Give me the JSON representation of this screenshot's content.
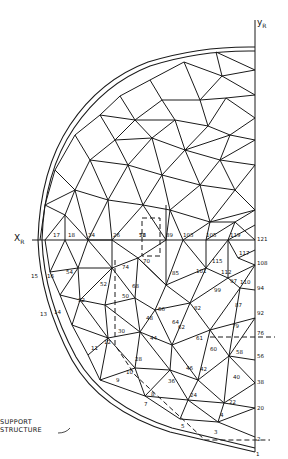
{
  "diagram": {
    "type": "geodesic dome triangulated mesh (quarter view)",
    "axes": {
      "x_label": "X",
      "x_sub": "R",
      "y_label": "y",
      "y_sub": "R"
    },
    "support_label_line1": "SUPPORT",
    "support_label_line2": "STRUCTURE",
    "node_labels": {
      "n1": "1",
      "n2": "2",
      "n3": "3",
      "n4": "4",
      "n5": "5",
      "n7": "7",
      "n8": "8",
      "n9": "9",
      "n10": "10",
      "n11": "11",
      "n12": "12",
      "n13": "13",
      "n14": "14",
      "n15": "15",
      "n16": "16",
      "n17": "17",
      "n18": "18",
      "n20": "20",
      "n22": "22",
      "n24": "24",
      "n26": "26",
      "n28": "28",
      "n30": "30",
      "n32": "32",
      "n34": "34",
      "n36": "36",
      "n38": "38",
      "n40": "40",
      "n42": "42",
      "n44": "44",
      "n46": "46",
      "n48": "48",
      "n50": "50",
      "n52": "52",
      "n54": "54",
      "n56": "56",
      "n58": "58",
      "n60": "60",
      "n61": "61",
      "n62": "62",
      "n64": "64",
      "n66": "66",
      "n68": "68",
      "n70": "70",
      "n72": "72",
      "n74": "74",
      "n76": "76",
      "n79": "79",
      "n82": "82",
      "n85": "85",
      "n87": "87",
      "n89": "89",
      "n92": "92",
      "n94": "94",
      "n97": "97",
      "n99": "99",
      "n101": "101",
      "n103": "103",
      "n105": "105",
      "n108": "108",
      "n110": "110",
      "n112": "112",
      "n115": "115",
      "n117": "117",
      "n119": "119",
      "n121": "121"
    }
  }
}
